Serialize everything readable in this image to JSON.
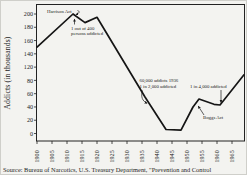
{
  "figure": {
    "y_axis_title": "Addicts (in  thousands)",
    "source": "Source:  Bureau of Narcotics, U.S. Treasury Department, \"Prevention and Control"
  },
  "chart_data": {
    "type": "line",
    "title": "",
    "xlabel": "",
    "ylabel": "Addicts (in thousands)",
    "x_ticks": [
      1900,
      1905,
      1910,
      1915,
      1920,
      1925,
      1930,
      1935,
      1940,
      1945,
      1950,
      1955,
      1960,
      1965
    ],
    "y_ticks": [
      200,
      180,
      160,
      140,
      120,
      80,
      60,
      40,
      20,
      0
    ],
    "ylim": [
      0,
      200
    ],
    "x_range": [
      1900,
      1969
    ],
    "grid": false,
    "legend": "none",
    "series": [
      {
        "name": "Addicts (in thousands)",
        "points": [
          [
            1900,
            150
          ],
          [
            1912,
            200
          ],
          [
            1916,
            187
          ],
          [
            1920,
            195
          ],
          [
            1936,
            55
          ],
          [
            1943,
            6
          ],
          [
            1948,
            5
          ],
          [
            1952,
            40
          ],
          [
            1954,
            52
          ],
          [
            1959,
            44
          ],
          [
            1961,
            43
          ],
          [
            1969,
            97
          ]
        ]
      }
    ],
    "annotations": [
      {
        "text": "Harrison Act",
        "target_year": 1912
      },
      {
        "text": "1 out of 400",
        "text2": "persons addicted",
        "target_year": 1913
      },
      {
        "text": "60,000 addicts 1936",
        "text2": "1 in 2,000 addicted",
        "target_year": 1938
      },
      {
        "text": "1 in 4,000 addicted",
        "target_year": 1960
      },
      {
        "text": "Boggs Act",
        "target_year": 1953
      }
    ],
    "source": "Source: Bureau of Narcotics, U.S. Treasury Department, \"Prevention and Control"
  }
}
